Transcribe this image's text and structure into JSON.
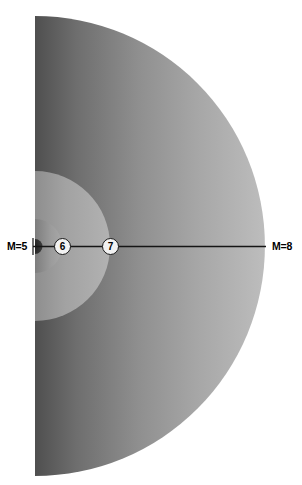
{
  "diagram": {
    "type": "half-disk-zones",
    "center": {
      "x": 35,
      "y": 246
    },
    "axis_line": {
      "from_x": 35,
      "to_x": 265,
      "y": 246
    },
    "labels": {
      "left": "M=5",
      "right": "M=8"
    },
    "nodes": [
      {
        "id": "node-6",
        "label": "6",
        "x": 62,
        "y": 246
      },
      {
        "id": "node-7",
        "label": "7",
        "x": 110,
        "y": 246
      }
    ],
    "zones": [
      {
        "name": "M=5",
        "radius": 7,
        "fill": "#3a3a3a"
      },
      {
        "name": "6",
        "radius": 27,
        "fill": "#9c9c9c"
      },
      {
        "name": "7",
        "radius": 75,
        "fill": "#ababab"
      },
      {
        "name": "M=8",
        "radius": 230,
        "fill": "#8d8d8d"
      }
    ],
    "colors": {
      "background": "#ffffff",
      "outer_dark": "#565656",
      "outer_light": "#b8b8b8",
      "inner_mid": "#a9a9a9",
      "inner_small": "#9a9a9a",
      "core": "#333333",
      "line": "#161616",
      "node_fill": "#f2f2f2",
      "node_stroke": "#1a1a1a",
      "text": "#000000"
    }
  }
}
